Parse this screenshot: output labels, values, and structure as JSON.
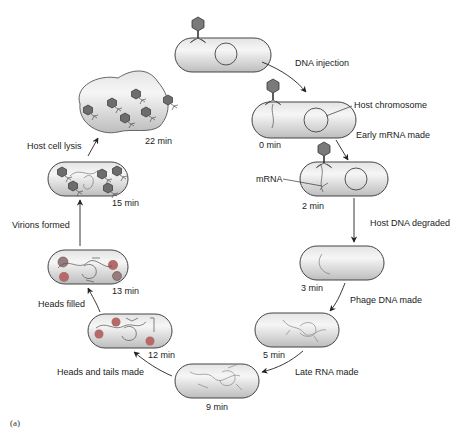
{
  "diagram": {
    "panel_label": "(a)",
    "colors": {
      "cell_fill_light": "#f1f1f1",
      "cell_fill_dark": "#c9c9c9",
      "outline": "#444444",
      "phage_head": "#7a7a7a",
      "red_head": "#b56a6a",
      "text": "#222222"
    },
    "stages": [
      {
        "id": "attach",
        "time": ""
      },
      {
        "id": "t0",
        "time": "0 min"
      },
      {
        "id": "t2",
        "time": "2 min"
      },
      {
        "id": "t3",
        "time": "3 min"
      },
      {
        "id": "t5",
        "time": "5 min"
      },
      {
        "id": "t9",
        "time": "9 min"
      },
      {
        "id": "t12",
        "time": "12 min"
      },
      {
        "id": "t13",
        "time": "13 min"
      },
      {
        "id": "t15",
        "time": "15 min"
      },
      {
        "id": "t22",
        "time": "22 min"
      }
    ],
    "steps": [
      "DNA injection",
      "Early mRNA made",
      "Host DNA degraded",
      "Phage DNA made",
      "Late RNA made",
      "Heads and tails made",
      "Heads filled",
      "Virions formed",
      "Host cell lysis"
    ],
    "callouts": {
      "host_chromosome": "Host chromosome",
      "mrna": "mRNA"
    }
  }
}
